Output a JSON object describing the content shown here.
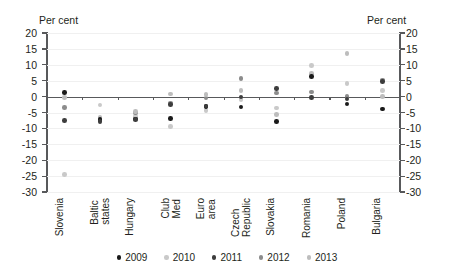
{
  "axis": {
    "unit_left": "Per cent",
    "unit_right": "Per cent",
    "yticks": [
      20,
      15,
      10,
      5,
      0,
      -5,
      -10,
      -15,
      -20,
      -25,
      -30
    ]
  },
  "legend": {
    "items": [
      {
        "label": "2009",
        "color": "#1a1a1a"
      },
      {
        "label": "2010",
        "color": "#c9c9c9"
      },
      {
        "label": "2011",
        "color": "#3d3d3d"
      },
      {
        "label": "2012",
        "color": "#8c8c8c"
      },
      {
        "label": "2013",
        "color": "#bdbdbd"
      }
    ]
  },
  "chart_data": {
    "type": "scatter",
    "title": "",
    "subtitle": "",
    "xlabel": "",
    "ylabel": "Per cent",
    "ylim": [
      -30,
      20
    ],
    "ytick_step": 5,
    "grid": true,
    "legend_position": "bottom",
    "categories": [
      "Slovenia",
      "Baltic\nstates",
      "Hungary",
      "Club\nMed",
      "Euro\narea",
      "Czech\nRepublic",
      "Slovakia",
      "Romania",
      "Poland",
      "Bulgaria"
    ],
    "series": [
      {
        "name": "2009",
        "color": "#1a1a1a",
        "values": [
          1.3,
          -7.2,
          -7.0,
          -6.8,
          -3.2,
          -3.3,
          -7.8,
          6.4,
          -2.3,
          -3.9
        ]
      },
      {
        "name": "2010",
        "color": "#c9c9c9",
        "values": [
          -24.5,
          -2.6,
          -6.3,
          -9.4,
          -4.4,
          -1.0,
          -3.6,
          9.7,
          4.1,
          2.0
        ]
      },
      {
        "name": "2011",
        "color": "#3d3d3d",
        "values": [
          -7.5,
          -7.8,
          -7.2,
          -2.4,
          -3.0,
          -0.1,
          2.5,
          -0.3,
          -0.8,
          4.7
        ]
      },
      {
        "name": "2012",
        "color": "#8c8c8c",
        "values": [
          -3.5,
          -7.0,
          -5.1,
          -2.0,
          -0.4,
          5.6,
          1.1,
          1.5,
          0.1,
          5.2
        ]
      },
      {
        "name": "2013",
        "color": "#bdbdbd",
        "values": [
          -0.2,
          -6.5,
          -4.6,
          0.8,
          0.6,
          2.0,
          -5.6,
          7.2,
          13.6,
          0.0
        ]
      }
    ]
  }
}
